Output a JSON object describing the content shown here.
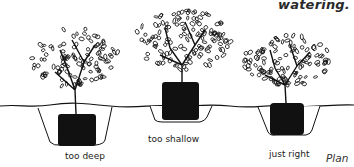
{
  "heading": "watering.",
  "figure": {
    "shrubs": [
      {
        "id": "too-deep",
        "label": "too deep"
      },
      {
        "id": "too-shallow",
        "label": "too shallow"
      },
      {
        "id": "just-right",
        "label": "just right"
      }
    ]
  },
  "caption_lines": [
    "Plan",
    "shru",
    "with"
  ]
}
